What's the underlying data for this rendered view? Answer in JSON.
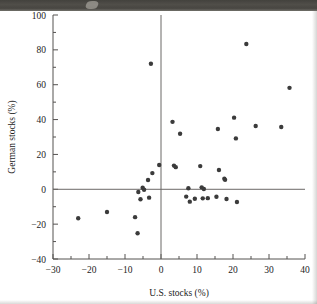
{
  "figure": {
    "background_color": "#ffffff",
    "point_color": "#3b3b3b",
    "axis_color": "#555250",
    "artifact": "dark-scan-band-top"
  },
  "chart_data": {
    "type": "scatter",
    "title": "",
    "xlabel": "U.S. stocks (%)",
    "ylabel": "German stocks (%)",
    "xlim": [
      -30,
      40
    ],
    "ylim": [
      -40,
      100
    ],
    "xticks": [
      -30,
      -20,
      -10,
      0,
      10,
      20,
      30,
      40
    ],
    "xtick_labels": [
      "-30",
      "-20",
      "-10",
      "0",
      "10",
      "20",
      "30",
      "40"
    ],
    "yticks": [
      -40,
      -20,
      0,
      20,
      40,
      60,
      80,
      100
    ],
    "ytick_labels": [
      "-40",
      "-20",
      "0",
      "20",
      "40",
      "60",
      "80",
      "100"
    ],
    "x_minor_step": 5,
    "y_minor_step": 10,
    "grid": false,
    "legend": null,
    "reference_lines": [
      {
        "axis": "y",
        "value": 0
      },
      {
        "axis": "x",
        "value": 0
      }
    ],
    "series": [
      {
        "name": "Annual returns",
        "marker": "circle",
        "color": "#3b3b3b",
        "points": [
          [
            -23.0,
            -16.6
          ],
          [
            -15.0,
            -13.0
          ],
          [
            -7.2,
            -16.0
          ],
          [
            -6.5,
            -25.2
          ],
          [
            -6.3,
            -1.6
          ],
          [
            -5.7,
            -5.7
          ],
          [
            -5.1,
            0.9
          ],
          [
            -4.7,
            -0.3
          ],
          [
            -3.6,
            5.3
          ],
          [
            -3.3,
            -4.8
          ],
          [
            -2.8,
            72.0
          ],
          [
            -2.4,
            9.3
          ],
          [
            -0.5,
            13.9
          ],
          [
            3.2,
            38.7
          ],
          [
            3.6,
            13.6
          ],
          [
            4.1,
            12.7
          ],
          [
            5.3,
            31.9
          ],
          [
            7.0,
            -4.2
          ],
          [
            7.6,
            0.6
          ],
          [
            8.0,
            -7.1
          ],
          [
            9.4,
            -5.4
          ],
          [
            10.9,
            13.3
          ],
          [
            11.3,
            1.1
          ],
          [
            11.6,
            -5.2
          ],
          [
            11.9,
            0.2
          ],
          [
            13.0,
            -5.1
          ],
          [
            15.4,
            -4.3
          ],
          [
            15.8,
            34.6
          ],
          [
            16.1,
            11.1
          ],
          [
            17.6,
            6.1
          ],
          [
            17.8,
            5.4
          ],
          [
            18.2,
            -5.6
          ],
          [
            20.3,
            41.1
          ],
          [
            20.8,
            29.2
          ],
          [
            21.1,
            -7.3
          ],
          [
            23.7,
            83.4
          ],
          [
            26.3,
            36.3
          ],
          [
            33.4,
            35.7
          ],
          [
            35.7,
            58.2
          ]
        ]
      }
    ]
  }
}
